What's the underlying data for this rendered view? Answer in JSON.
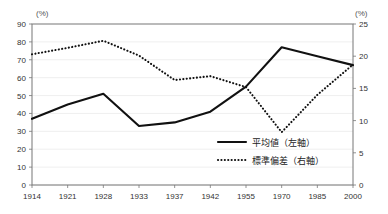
{
  "chart_data": {
    "type": "line",
    "title": "",
    "xlabel": "",
    "ylabel": "",
    "left_axis": {
      "unit_label": "(%)",
      "ticks": [
        0,
        10,
        20,
        30,
        40,
        50,
        60,
        70,
        80,
        90
      ],
      "ylim": [
        0,
        90
      ]
    },
    "right_axis": {
      "unit_label": "(%)",
      "ticks": [
        0,
        5,
        10,
        15,
        20,
        25
      ],
      "ylim": [
        0,
        25
      ]
    },
    "categories": [
      "1914",
      "1921",
      "1928",
      "1933",
      "1937",
      "1942",
      "1955",
      "1970",
      "1985",
      "2000"
    ],
    "grid": true,
    "legend_position": "inside-bottom-right",
    "series": [
      {
        "name": "平均値（左軸）",
        "axis": "left",
        "style": "solid",
        "values": [
          37,
          45,
          51,
          33,
          35,
          41,
          55,
          77,
          72,
          67
        ]
      },
      {
        "name": "標準偏差（右軸）",
        "axis": "right",
        "style": "dotted",
        "values": [
          20.3,
          21.3,
          22.4,
          20.1,
          16.3,
          16.9,
          15.2,
          8.2,
          14.0,
          18.7
        ]
      }
    ]
  },
  "legend": {
    "items": [
      {
        "label": "平均値（左軸）",
        "style": "solid"
      },
      {
        "label": "標準偏差（右軸）",
        "style": "dotted"
      }
    ]
  },
  "colors": {
    "series": "#111111",
    "grid": "#e8e8e8",
    "axis": "#777777",
    "text": "#222222"
  }
}
